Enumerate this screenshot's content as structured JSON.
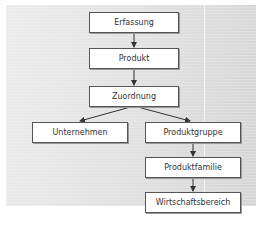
{
  "diagram": {
    "nodes": [
      {
        "id": "erfassung",
        "label": "Erfassung"
      },
      {
        "id": "produkt",
        "label": "Produkt"
      },
      {
        "id": "zuordnung",
        "label": "Zuordnung"
      },
      {
        "id": "unternehmen",
        "label": "Unternehmen"
      },
      {
        "id": "produktgruppe",
        "label": "Produktgruppe"
      },
      {
        "id": "produktfamilie",
        "label": "Produktfamilie"
      },
      {
        "id": "wirtschaftsbereich",
        "label": "Wirtschaftsbereich"
      }
    ],
    "edges": [
      {
        "from": "erfassung",
        "to": "produkt"
      },
      {
        "from": "produkt",
        "to": "zuordnung"
      },
      {
        "from": "zuordnung",
        "to": "unternehmen"
      },
      {
        "from": "zuordnung",
        "to": "produktgruppe"
      },
      {
        "from": "produktgruppe",
        "to": "produktfamilie"
      },
      {
        "from": "produktfamilie",
        "to": "wirtschaftsbereich"
      }
    ],
    "colors": {
      "box_fill": "#ffffff",
      "box_border": "#555555",
      "arrow": "#333333",
      "background": "#e2e2e2"
    }
  }
}
